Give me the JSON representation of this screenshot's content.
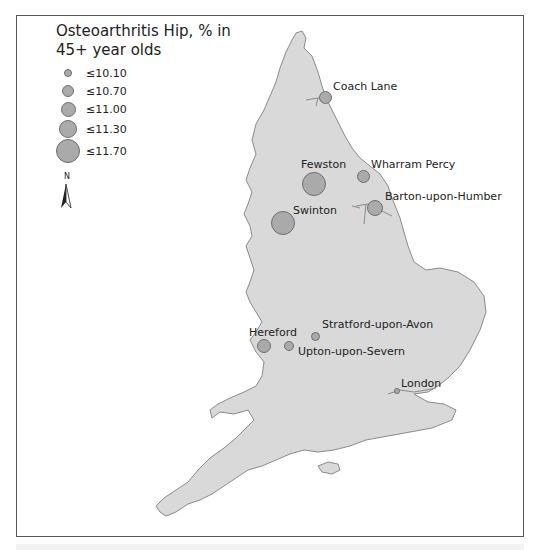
{
  "legend": {
    "title_line1": "Osteoarthritis Hip, % in",
    "title_line2": "45+ year olds",
    "classes": [
      {
        "label": "≤10.10",
        "diameter": 8
      },
      {
        "label": "≤10.70",
        "diameter": 12
      },
      {
        "label": "≤11.00",
        "diameter": 15
      },
      {
        "label": "≤11.30",
        "diameter": 18
      },
      {
        "label": "≤11.70",
        "diameter": 24
      }
    ]
  },
  "north_arrow": {
    "label": "N",
    "icon": "north-arrow-icon"
  },
  "colors": {
    "land": "#d9d9d9",
    "coast": "#8a8a8a",
    "symbol_fill": "#aaaaaa",
    "symbol_stroke": "#6e6e6e",
    "frame": "#555555"
  },
  "places": [
    {
      "name": "Coach Lane",
      "x": 325,
      "y": 97,
      "d": 13,
      "lx": 333,
      "ly": 80
    },
    {
      "name": "Fewston",
      "x": 314,
      "y": 184,
      "d": 24,
      "lx": 301,
      "ly": 158
    },
    {
      "name": "Wharram Percy",
      "x": 363,
      "y": 176,
      "d": 13,
      "lx": 371,
      "ly": 158
    },
    {
      "name": "Barton-upon-Humber",
      "x": 375,
      "y": 208,
      "d": 16,
      "lx": 385,
      "ly": 190
    },
    {
      "name": "Swinton",
      "x": 283,
      "y": 223,
      "d": 24,
      "lx": 293,
      "ly": 204
    },
    {
      "name": "Stratford-upon-Avon",
      "x": 315,
      "y": 336,
      "d": 9,
      "lx": 322,
      "ly": 318
    },
    {
      "name": "Hereford",
      "x": 264,
      "y": 346,
      "d": 14,
      "lx": 249,
      "ly": 326
    },
    {
      "name": "Upton-upon-Severn",
      "x": 289,
      "y": 346,
      "d": 10,
      "lx": 298,
      "ly": 345
    },
    {
      "name": "London",
      "x": 397,
      "y": 391,
      "d": 6,
      "lx": 401,
      "ly": 377
    }
  ]
}
